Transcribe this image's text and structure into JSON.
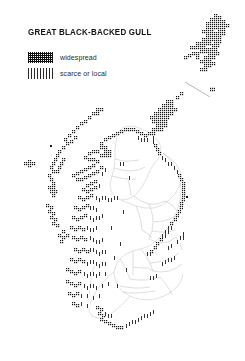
{
  "document": {
    "type": "distribution-map",
    "title": "GREAT BLACK-BACKED GULL",
    "region_depicted": "Scotland",
    "background_color": "#ffffff",
    "ink_color": "#1a1a1a"
  },
  "legend": {
    "items": [
      {
        "swatch": "dense-dark-stipple",
        "label": "widespread"
      },
      {
        "swatch": "light-hatch",
        "label": "scarce or local"
      }
    ]
  },
  "map_data": {
    "type": "dot-distribution",
    "grid": "10km-square",
    "symbol_classes": [
      "widespread",
      "scarce or local"
    ],
    "notes": "Breeding distribution concentrated on coasts, Shetland, Orkney and the Outer Hebrides; interior mainland largely unoccupied.",
    "areas": [
      {
        "name": "Shetland",
        "density": "widespread"
      },
      {
        "name": "Fair Isle",
        "density": "widespread"
      },
      {
        "name": "Orkney",
        "density": "widespread"
      },
      {
        "name": "Caithness and north coast",
        "density": "widespread"
      },
      {
        "name": "Outer Hebrides",
        "density": "widespread"
      },
      {
        "name": "St Kilda",
        "density": "widespread"
      },
      {
        "name": "Inner Hebrides and west coast",
        "density": "widespread"
      },
      {
        "name": "Argyll and Clyde islands",
        "density": "widespread"
      },
      {
        "name": "East coast Moray Firth to Aberdeenshire",
        "density": "scarce or local"
      },
      {
        "name": "Galloway and Solway coast",
        "density": "scarce or local"
      },
      {
        "name": "Central Lowlands interior",
        "density": "absent"
      },
      {
        "name": "Borders and southeast",
        "density": "absent"
      }
    ]
  }
}
